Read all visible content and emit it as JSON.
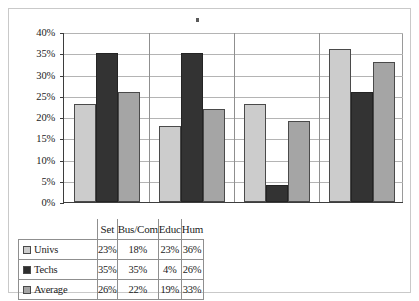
{
  "chart_data": {
    "type": "bar",
    "title": "",
    "xlabel": "",
    "ylabel": "",
    "ylim": [
      0,
      40
    ],
    "ytick_labels": [
      "40%",
      "35%",
      "30%",
      "25%",
      "20%",
      "15%",
      "10%",
      "5%",
      "0%"
    ],
    "ytick_values": [
      40,
      35,
      30,
      25,
      20,
      15,
      10,
      5,
      0
    ],
    "grid": "horizontal",
    "legend_position": "table-first-column",
    "categories": [
      "Set",
      "Bus/Com",
      "Educ",
      "Hum"
    ],
    "series": [
      {
        "name": "Univs",
        "color": "#cccccc",
        "values": [
          23,
          18,
          23,
          36
        ],
        "labels": [
          "23%",
          "18%",
          "23%",
          "36%"
        ]
      },
      {
        "name": "Techs",
        "color": "#333333",
        "values": [
          35,
          35,
          4,
          26
        ],
        "labels": [
          "35%",
          "35%",
          "4%",
          "26%"
        ]
      },
      {
        "name": "Average",
        "color": "#a5a5a5",
        "values": [
          26,
          22,
          19,
          33
        ],
        "labels": [
          "26%",
          "22%",
          "19%",
          "33%"
        ]
      }
    ]
  },
  "table": {
    "corner_label": "",
    "column_headers": [
      "Set",
      "Bus/Com",
      "Educ",
      "Hum"
    ],
    "rows": [
      {
        "label": "Univs",
        "swatch": "swatch-light-gray",
        "values": [
          "23%",
          "18%",
          "23%",
          "36%"
        ]
      },
      {
        "label": "Techs",
        "swatch": "swatch-dark-gray",
        "values": [
          "35%",
          "35%",
          "4%",
          "26%"
        ]
      },
      {
        "label": "Average",
        "swatch": "swatch-medium-gray",
        "values": [
          "26%",
          "22%",
          "19%",
          "33%"
        ]
      }
    ]
  }
}
